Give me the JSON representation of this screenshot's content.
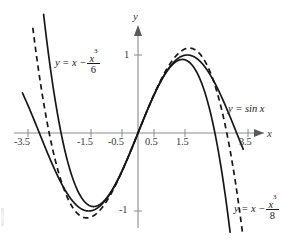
{
  "figure": {
    "background_color": "#ffffff",
    "curve_color": "#171717",
    "axis_color": "#8c8c8c"
  },
  "axes": {
    "x_axis_name": "x",
    "y_axis_name": "y",
    "x_ticks": [
      "-3.5",
      "-1.5",
      "-0.5",
      "0.5",
      "1.5",
      "3.5"
    ],
    "x_tick_values": [
      -3.5,
      -1.5,
      -0.5,
      0.5,
      1.5,
      3.5
    ],
    "y_ticks": [
      "1",
      "-1"
    ],
    "y_tick_values": [
      1,
      -1
    ]
  },
  "labels": {
    "sine": "y = sin x",
    "taylor6_prefix": "y = x −",
    "taylor6_num": "x",
    "taylor6_num_exp": "3",
    "taylor6_den": "6",
    "taylor8_prefix": "y = x −",
    "taylor8_num": "x",
    "taylor8_num_exp": "3",
    "taylor8_den": "8"
  },
  "chart_data": {
    "type": "line",
    "title": "",
    "xlabel": "x",
    "ylabel": "y",
    "xlim": [
      -3.7,
      3.9
    ],
    "ylim": [
      -1.45,
      1.5
    ],
    "grid": false,
    "legend": "inline-curve-labels",
    "origin_px": [
      138,
      133
    ],
    "px_per_unit_x": 31.4,
    "px_per_unit_y": 78,
    "xticks": [
      -3.5,
      -1.5,
      -0.5,
      0.5,
      1.5,
      3.5
    ],
    "yticks": [
      1,
      -1
    ],
    "series": [
      {
        "name": "y = sin x",
        "style": "solid",
        "formula": "sin(x)",
        "x_domain": [
          -3.68,
          3.35
        ],
        "x": [
          -3.68,
          -3.4,
          -3.0,
          -2.6,
          -2.2,
          -1.8,
          -1.5708,
          -1.4,
          -1.0,
          -0.6,
          -0.2,
          0.0,
          0.2,
          0.6,
          1.0,
          1.4,
          1.5708,
          1.8,
          2.2,
          2.6,
          3.0,
          3.35
        ],
        "values": [
          0.532,
          0.256,
          -0.141,
          -0.516,
          -0.808,
          -0.974,
          -1.0,
          -0.985,
          -0.841,
          -0.565,
          -0.199,
          0.0,
          0.199,
          0.565,
          0.841,
          0.985,
          1.0,
          0.974,
          0.808,
          0.516,
          0.141,
          -0.207
        ]
      },
      {
        "name": "y = x - x^3/6",
        "style": "solid",
        "formula": "x - x^3/6",
        "x_domain": [
          -3.03,
          3.03
        ],
        "x": [
          -3.03,
          -2.8,
          -2.4,
          -2.0,
          -1.7321,
          -1.4,
          -1.0,
          -0.6,
          -0.2,
          0.0,
          0.2,
          0.6,
          1.0,
          1.4,
          1.7321,
          2.0,
          2.4,
          2.8,
          3.03
        ],
        "values": [
          1.607,
          0.859,
          -0.096,
          -0.667,
          -0.7698,
          -0.943,
          -0.833,
          -0.564,
          -0.199,
          0.0,
          0.199,
          0.564,
          0.833,
          0.943,
          0.7698,
          0.667,
          0.096,
          -0.859,
          -1.607
        ]
      },
      {
        "name": "y = x - x^3/8",
        "style": "dashed",
        "formula": "x - x^3/8",
        "x_domain": [
          -3.35,
          3.35
        ],
        "x": [
          -3.35,
          -3.0,
          -2.6,
          -2.3094,
          -2.0,
          -1.6,
          -1.2,
          -0.8,
          -0.4,
          0.0,
          0.4,
          0.8,
          1.2,
          1.6,
          2.0,
          2.3094,
          2.6,
          3.0,
          3.35
        ],
        "values": [
          1.349,
          0.375,
          -0.4025,
          -1.0887,
          -1.0,
          -0.688,
          -0.984,
          -0.736,
          -0.392,
          0.0,
          0.392,
          0.736,
          0.984,
          0.688,
          1.0,
          1.0887,
          0.4025,
          -0.375,
          -1.349
        ]
      }
    ],
    "annotations": [
      {
        "text": "y = sin x",
        "x": 2.55,
        "y": 0.38
      },
      {
        "text": "y = x - x^3/6",
        "x": -2.4,
        "y": 0.92
      },
      {
        "text": "y = x - x^3/8",
        "x": 2.7,
        "y": -0.95
      }
    ]
  }
}
